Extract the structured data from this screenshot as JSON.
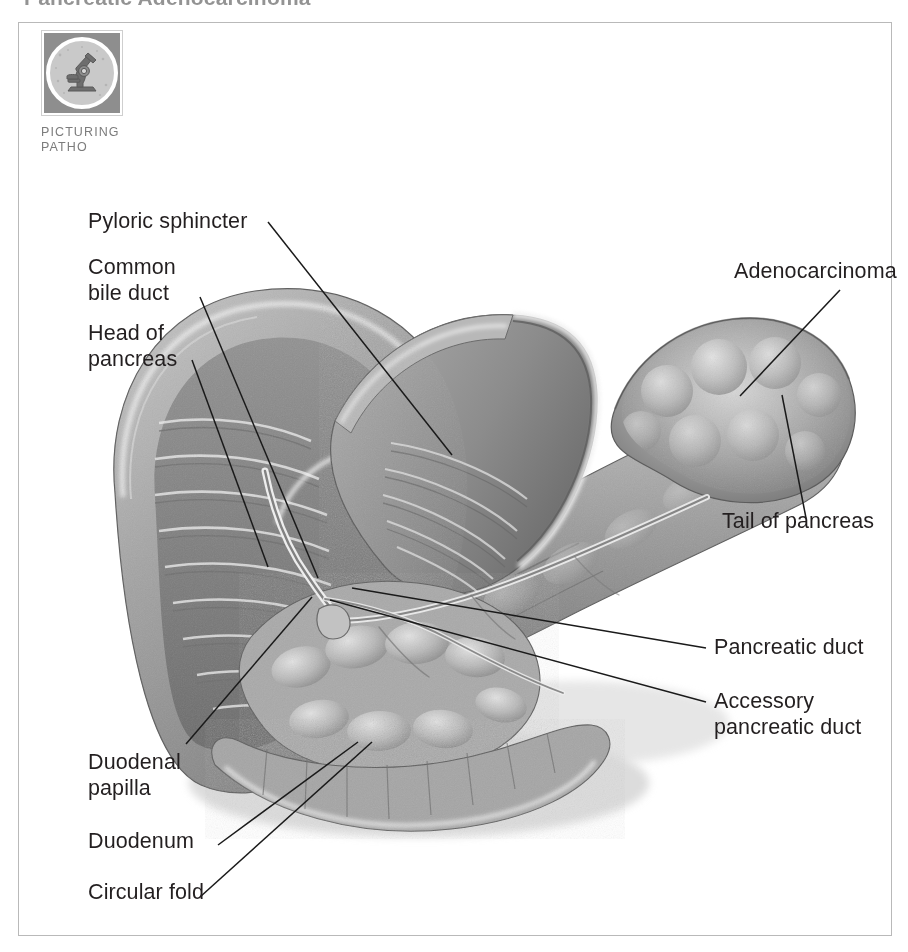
{
  "page": {
    "running_title": "Pancreatic Adenocarcinoma",
    "background_color": "#ffffff",
    "frame_color": "#b9b9b9"
  },
  "badge": {
    "icon": "microscope-icon",
    "line1": "PICTURING",
    "line2": "PATHO",
    "tile_color": "#8e8e8e",
    "circle_color": "#c9c9c9",
    "text_color": "#7c7c7c"
  },
  "illustration": {
    "name": "pancreas-duodenum-adenocarcinoma-illustration",
    "style": "grayscale medical airbrush illustration",
    "subject": "Pancreas with adenocarcinoma of the tail, duodenum opened to show ducts"
  },
  "labels": [
    {
      "id": "pyloric-sphincter",
      "text": "Pyloric sphincter",
      "side": "left"
    },
    {
      "id": "common-bile-duct",
      "text": "Common\nbile duct",
      "side": "left"
    },
    {
      "id": "head-of-pancreas",
      "text": "Head of\npancreas",
      "side": "left"
    },
    {
      "id": "duodenal-papilla",
      "text": "Duodenal\npapilla",
      "side": "left"
    },
    {
      "id": "duodenum",
      "text": "Duodenum",
      "side": "left"
    },
    {
      "id": "circular-fold",
      "text": "Circular fold",
      "side": "left"
    },
    {
      "id": "adenocarcinoma",
      "text": "Adenocarcinoma",
      "side": "right"
    },
    {
      "id": "tail-of-pancreas",
      "text": "Tail of pancreas",
      "side": "right"
    },
    {
      "id": "pancreatic-duct",
      "text": "Pancreatic duct",
      "side": "right"
    },
    {
      "id": "accessory-pancreatic-duct",
      "text": "Accessory\npancreatic duct",
      "side": "right"
    }
  ],
  "colors": {
    "text": "#231f20",
    "leader_line": "#1a1a1a",
    "tissue_mid": "#9a9a9a",
    "tissue_dark": "#6e6e6e",
    "tissue_light": "#d4d4d4",
    "highlight": "#f2f2f2"
  }
}
